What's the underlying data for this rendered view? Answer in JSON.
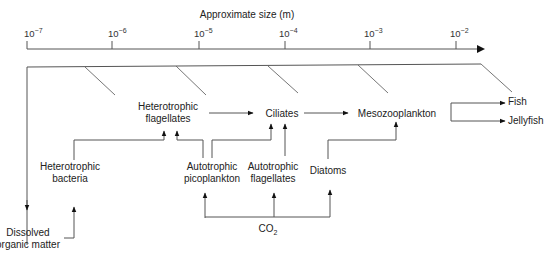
{
  "axis": {
    "title": "Approximate size (m)",
    "ticks": [
      {
        "base": "10",
        "exp": "−7"
      },
      {
        "base": "10",
        "exp": "−6"
      },
      {
        "base": "10",
        "exp": "−5"
      },
      {
        "base": "10",
        "exp": "−4"
      },
      {
        "base": "10",
        "exp": "−3"
      },
      {
        "base": "10",
        "exp": "−2"
      }
    ]
  },
  "nodes": {
    "het_flag": [
      "Heterotrophic",
      "flagellates"
    ],
    "ciliates": [
      "Ciliates"
    ],
    "meso": [
      "Mesozooplankton"
    ],
    "fish": [
      "Fish"
    ],
    "jelly": [
      "Jellyfish"
    ],
    "het_bact": [
      "Heterotrophic",
      "bacteria"
    ],
    "auto_pico": [
      "Autotrophic",
      "picoplankton"
    ],
    "auto_flag": [
      "Autotrophic",
      "flagellates"
    ],
    "diatoms": [
      "Diatoms"
    ],
    "dom": [
      "Dissolved",
      "organic matter"
    ],
    "co2": {
      "base": "CO",
      "sub": "2"
    }
  },
  "edges": [
    {
      "from": "Heterotrophic flagellates",
      "to": "Ciliates"
    },
    {
      "from": "Ciliates",
      "to": "Mesozooplankton"
    },
    {
      "from": "Mesozooplankton",
      "to": "Fish"
    },
    {
      "from": "Mesozooplankton",
      "to": "Jellyfish"
    },
    {
      "from": "Heterotrophic bacteria",
      "to": "Heterotrophic flagellates"
    },
    {
      "from": "Autotrophic picoplankton",
      "to": "Heterotrophic flagellates"
    },
    {
      "from": "Autotrophic picoplankton",
      "to": "Ciliates"
    },
    {
      "from": "Autotrophic flagellates",
      "to": "Ciliates"
    },
    {
      "from": "Diatoms",
      "to": "Mesozooplankton"
    },
    {
      "from": "CO2",
      "to": "Autotrophic picoplankton"
    },
    {
      "from": "CO2",
      "to": "Autotrophic flagellates"
    },
    {
      "from": "CO2",
      "to": "Diatoms"
    },
    {
      "from": "Dissolved organic matter",
      "to": "Heterotrophic bacteria"
    },
    {
      "from": "All organisms",
      "to": "Dissolved organic matter"
    }
  ]
}
